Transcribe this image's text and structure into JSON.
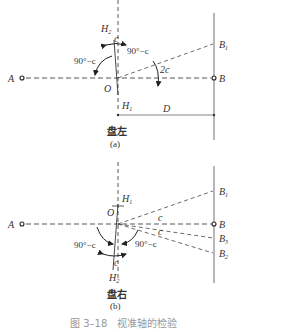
{
  "figure": {
    "caption": "图 3–18　视准轴的检验",
    "panel_a": {
      "title": "盘左",
      "sub": "(a)",
      "points": {
        "A": "A",
        "B": "B",
        "B1": "B",
        "B1_sub": "1",
        "O": "O",
        "H1": "H",
        "H1_sub": "1",
        "H2": "H",
        "H2_sub": "2"
      },
      "angles": {
        "left": "90°−c",
        "right": "90°−c",
        "double": "2c",
        "small": "c"
      },
      "distance": "D"
    },
    "panel_b": {
      "title": "盘右",
      "sub": "(b)",
      "points": {
        "A": "A",
        "B": "B",
        "B1": "B",
        "B1_sub": "1",
        "B2": "B",
        "B2_sub": "2",
        "B3": "B",
        "B3_sub": "3",
        "O": "O",
        "H1": "H",
        "H1_sub": "1",
        "H2": "H",
        "H2_sub": "2"
      },
      "angles": {
        "left": "90°−c",
        "right": "90°−c",
        "c1": "c",
        "c2": "c",
        "small": "c"
      }
    }
  }
}
